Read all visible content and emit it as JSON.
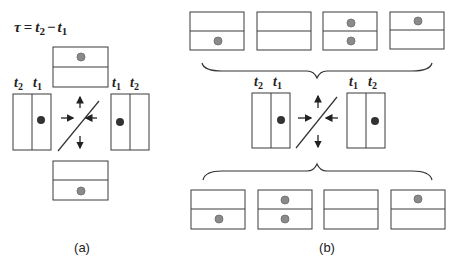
{
  "equation": {
    "lhs": "τ",
    "eq": "=",
    "t2": "t",
    "t2_sub": "2",
    "minus": "−",
    "t1": "t",
    "t1_sub": "1"
  },
  "panel_a": {
    "label": "(a)",
    "left_detector": {
      "label_left": "t",
      "label_left_sub": "2",
      "label_right": "t",
      "label_right_sub": "1",
      "dot_in": "right"
    },
    "right_detector": {
      "label_left": "t",
      "label_left_sub": "1",
      "label_right": "t",
      "label_right_sub": "2",
      "dot_in": "left"
    },
    "top_output": {
      "dot_in": "top"
    },
    "bottom_output": {
      "dot_in": "bottom"
    }
  },
  "panel_b": {
    "label": "(b)",
    "left_detector": {
      "label_left": "t",
      "label_left_sub": "2",
      "label_right": "t",
      "label_right_sub": "1",
      "dot_in": "right"
    },
    "right_detector": {
      "label_left": "t",
      "label_left_sub": "1",
      "label_right": "t",
      "label_right_sub": "2",
      "dot_in": "right"
    },
    "top_outputs": [
      {
        "dots": [
          "bottom"
        ]
      },
      {
        "dots": []
      },
      {
        "dots": [
          "top",
          "bottom"
        ]
      },
      {
        "dots": [
          "top"
        ]
      }
    ],
    "bottom_outputs": [
      {
        "dots": [
          "bottom"
        ]
      },
      {
        "dots": [
          "top",
          "bottom"
        ]
      },
      {
        "dots": []
      },
      {
        "dots": [
          "top"
        ]
      }
    ]
  },
  "colors": {
    "stroke": "#3a3a3a",
    "dot_gray": "#8a8a8a",
    "dot_dark": "#333333"
  }
}
